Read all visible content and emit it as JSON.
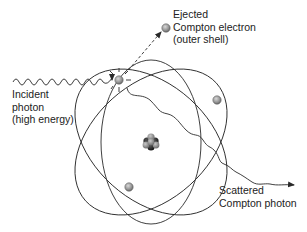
{
  "diagram": {
    "labels": {
      "ejected": {
        "line1": "Ejected",
        "line2": "Compton electron",
        "line3": "(outer shell)"
      },
      "incident": {
        "line1": "Incident",
        "line2": "photon",
        "line3": "(high energy)"
      },
      "scattered": {
        "line1": "Scattered",
        "line2": "Compton photon"
      }
    },
    "nodes": [
      {
        "id": "nucleus",
        "label": "nucleus",
        "x": 151,
        "y": 142
      },
      {
        "id": "target-electron",
        "label": "outer shell electron (struck)",
        "x": 119,
        "y": 80
      },
      {
        "id": "ejected-electron",
        "label": "Ejected Compton electron",
        "x": 166,
        "y": 28
      },
      {
        "id": "orbit-electron-right",
        "label": "orbital electron",
        "x": 217,
        "y": 100
      },
      {
        "id": "orbit-electron-lower",
        "label": "orbital electron",
        "x": 129,
        "y": 187
      }
    ],
    "edges": [
      {
        "from": "incident-photon",
        "to": "target-electron",
        "style": "wavy-arrow"
      },
      {
        "from": "target-electron",
        "to": "ejected-electron",
        "style": "dashed-arrow"
      },
      {
        "from": "target-electron",
        "to": "scattered-photon",
        "style": "wavy-arrow"
      }
    ],
    "orbits": [
      {
        "name": "orbit-vertical",
        "cx": 151,
        "cy": 142,
        "rx": 50,
        "ry": 82,
        "rotation": 0
      },
      {
        "name": "orbit-tilted-left",
        "cx": 151,
        "cy": 142,
        "rx": 58,
        "ry": 88,
        "rotation": -48
      },
      {
        "name": "orbit-tilted-right",
        "cx": 151,
        "cy": 142,
        "rx": 58,
        "ry": 88,
        "rotation": 48
      }
    ],
    "colors": {
      "line": "#2a2a2a",
      "electron_fill": "#9a9a9a",
      "electron_stroke": "#555555",
      "nucleus_dark": "#1a1a1a",
      "nucleus_light": "#8a8a8a",
      "text": "#222222"
    }
  }
}
